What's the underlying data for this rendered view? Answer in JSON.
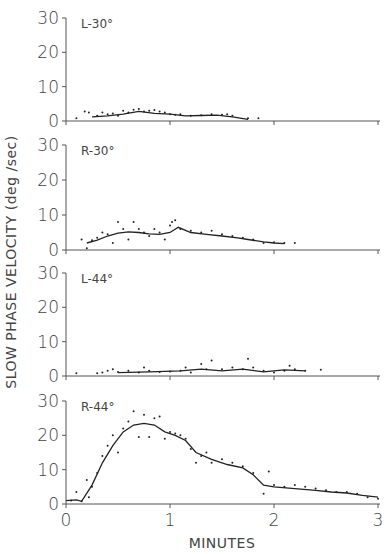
{
  "chart_data": {
    "type": "scatter",
    "ylabel": "SLOW PHASE VELOCITY (deg /sec)",
    "xlabel": "MINUTES",
    "xlim": [
      0,
      3
    ],
    "xticks": [
      "0",
      "1",
      "2",
      "3"
    ],
    "ylim": [
      0,
      30
    ],
    "yticks": [
      "0",
      "10",
      "20",
      "30"
    ],
    "grid": false,
    "legend": "none",
    "panels": [
      {
        "label": "L-30°",
        "fit_line": {
          "x": [
            0.25,
            0.4,
            0.55,
            0.7,
            0.85,
            1.0,
            1.15,
            1.3,
            1.45,
            1.6,
            1.75
          ],
          "y": [
            1.2,
            1.5,
            2.0,
            2.8,
            2.2,
            2.0,
            1.5,
            1.6,
            1.7,
            1.2,
            0.5
          ]
        },
        "points": {
          "x": [
            0.1,
            0.18,
            0.22,
            0.3,
            0.35,
            0.4,
            0.45,
            0.5,
            0.55,
            0.6,
            0.65,
            0.7,
            0.75,
            0.8,
            0.85,
            0.9,
            0.95,
            1.0,
            1.05,
            1.1,
            1.2,
            1.3,
            1.4,
            1.5,
            1.55,
            1.6,
            1.75,
            1.85
          ],
          "y": [
            0.8,
            2.8,
            2.5,
            1.5,
            2.5,
            2.0,
            2.2,
            1.5,
            3.0,
            2.5,
            3.3,
            3.5,
            2.8,
            3.0,
            3.2,
            2.8,
            2.5,
            2.0,
            1.8,
            2.0,
            1.5,
            1.7,
            2.0,
            1.8,
            2.0,
            1.5,
            0.8,
            0.8
          ]
        }
      },
      {
        "label": "R-30°",
        "fit_line": {
          "x": [
            0.2,
            0.3,
            0.4,
            0.5,
            0.6,
            0.7,
            0.8,
            0.9,
            1.0,
            1.08,
            1.2,
            1.35,
            1.5,
            1.65,
            1.75,
            1.9,
            2.0,
            2.1
          ],
          "y": [
            2.0,
            2.8,
            4.0,
            4.8,
            5.2,
            5.0,
            4.6,
            4.5,
            5.0,
            6.5,
            5.0,
            4.5,
            4.0,
            3.5,
            3.0,
            2.3,
            2.0,
            1.8
          ]
        },
        "points": {
          "x": [
            0.15,
            0.2,
            0.25,
            0.3,
            0.35,
            0.4,
            0.45,
            0.5,
            0.55,
            0.6,
            0.65,
            0.7,
            0.75,
            0.8,
            0.85,
            0.9,
            0.95,
            1.0,
            1.02,
            1.05,
            1.1,
            1.2,
            1.3,
            1.4,
            1.5,
            1.6,
            1.7,
            1.8,
            1.9,
            2.0,
            2.1,
            2.2
          ],
          "y": [
            3.0,
            0.5,
            2.8,
            3.5,
            5.0,
            4.5,
            2.0,
            8.0,
            6.0,
            3.0,
            8.0,
            6.0,
            5.0,
            4.0,
            6.0,
            5.0,
            3.0,
            7.0,
            8.0,
            8.5,
            6.0,
            5.5,
            5.0,
            5.5,
            4.5,
            4.0,
            3.5,
            3.0,
            2.0,
            2.2,
            2.0,
            2.0
          ]
        }
      },
      {
        "label": "L-44°",
        "fit_line": {
          "x": [
            0.5,
            0.8,
            1.1,
            1.3,
            1.5,
            1.7,
            1.9,
            2.1,
            2.3
          ],
          "y": [
            1.0,
            1.2,
            1.5,
            2.0,
            1.5,
            2.0,
            1.2,
            1.8,
            1.5
          ]
        },
        "points": {
          "x": [
            0.1,
            0.3,
            0.35,
            0.4,
            0.45,
            0.5,
            0.6,
            0.7,
            0.75,
            0.8,
            0.9,
            1.0,
            1.1,
            1.15,
            1.2,
            1.3,
            1.35,
            1.4,
            1.5,
            1.6,
            1.7,
            1.75,
            1.8,
            1.9,
            2.0,
            2.1,
            2.15,
            2.2,
            2.3,
            2.45
          ],
          "y": [
            0.8,
            0.8,
            1.0,
            1.5,
            2.0,
            1.2,
            1.5,
            1.0,
            2.5,
            1.5,
            1.2,
            1.3,
            1.5,
            2.5,
            1.0,
            3.5,
            2.0,
            4.5,
            2.0,
            2.5,
            2.0,
            5.0,
            2.5,
            1.5,
            1.0,
            1.5,
            3.0,
            2.0,
            1.5,
            1.8
          ]
        }
      },
      {
        "label": "R-44°",
        "fit_line": {
          "x": [
            0.0,
            0.1,
            0.15,
            0.25,
            0.35,
            0.45,
            0.55,
            0.65,
            0.75,
            0.85,
            0.95,
            1.05,
            1.15,
            1.25,
            1.4,
            1.55,
            1.7,
            1.8,
            1.9,
            2.0,
            2.2,
            2.4,
            2.55,
            2.7,
            2.85,
            3.0
          ],
          "y": [
            1.0,
            1.2,
            0.8,
            5.5,
            12.0,
            17.0,
            21.0,
            23.0,
            23.5,
            23.0,
            21.0,
            20.0,
            18.5,
            15.0,
            13.0,
            11.5,
            10.5,
            8.5,
            5.5,
            5.0,
            4.5,
            4.0,
            3.5,
            3.2,
            2.5,
            2.0
          ]
        },
        "points": {
          "x": [
            0.05,
            0.1,
            0.15,
            0.2,
            0.22,
            0.25,
            0.3,
            0.35,
            0.4,
            0.45,
            0.5,
            0.55,
            0.6,
            0.65,
            0.7,
            0.75,
            0.8,
            0.85,
            0.9,
            0.95,
            1.0,
            1.05,
            1.1,
            1.15,
            1.2,
            1.25,
            1.3,
            1.35,
            1.4,
            1.5,
            1.6,
            1.7,
            1.8,
            1.9,
            1.95,
            2.0,
            2.1,
            2.2,
            2.3,
            2.4,
            2.5,
            2.6,
            2.7,
            2.8,
            2.9,
            3.0
          ],
          "y": [
            1.0,
            3.5,
            0.8,
            7.0,
            2.0,
            5.0,
            9.0,
            14.0,
            17.0,
            20.0,
            15.0,
            22.0,
            24.0,
            27.0,
            19.5,
            26.0,
            19.5,
            25.0,
            25.5,
            19.0,
            21.0,
            20.5,
            20.0,
            19.0,
            16.0,
            12.0,
            14.0,
            15.0,
            12.0,
            13.0,
            12.0,
            11.0,
            9.0,
            3.0,
            9.5,
            5.5,
            5.0,
            5.5,
            5.0,
            4.5,
            4.0,
            3.5,
            3.5,
            3.0,
            2.0,
            1.5
          ]
        }
      }
    ]
  }
}
